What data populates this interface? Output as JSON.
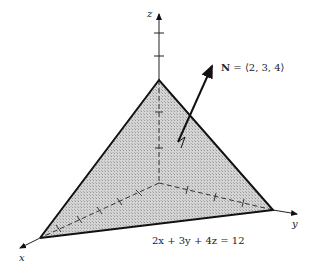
{
  "diagram": {
    "axes": {
      "x_label": "x",
      "y_label": "y",
      "z_label": "z"
    },
    "normal_vector": {
      "label_bold": "N",
      "label_rest": " = ⟨2, 3, 4⟩",
      "components": [
        2,
        3,
        4
      ]
    },
    "plane_equation": "2x + 3y + 4z = 12",
    "intercepts": {
      "x": 6,
      "y": 4,
      "z": 3
    },
    "colors": {
      "fill": "#c8c8c8",
      "edge": "#111111",
      "axis": "#222222"
    }
  }
}
